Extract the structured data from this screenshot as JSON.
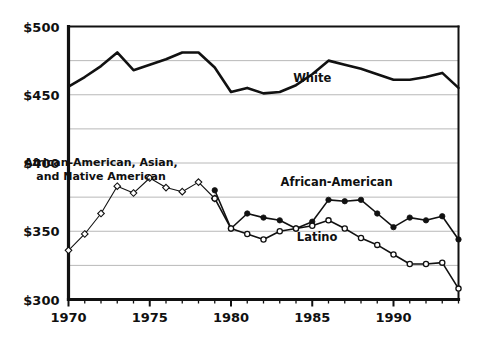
{
  "chart_data": {
    "type": "line",
    "title": "",
    "subtitle": "",
    "xlabel": "",
    "ylabel": "",
    "xlim": [
      1970,
      1994
    ],
    "ylim": [
      300,
      500
    ],
    "ytick_labels": [
      "$500",
      "$450",
      "$400",
      "$350",
      "$300"
    ],
    "ytick_values": [
      500,
      450,
      400,
      350,
      300
    ],
    "xtick_labels": [
      "1970",
      "1975",
      "1980",
      "1985",
      "1990"
    ],
    "xtick_values": [
      1970,
      1975,
      1980,
      1985,
      1990
    ],
    "minor_ytick_values": [
      475,
      425,
      375,
      325
    ],
    "grid": "horizontal",
    "grid_color": "#b8b8b8",
    "legend_position": "inline-annotations",
    "line_color": "#111111",
    "marker_open_fill": "#ffffff",
    "marker_closed_fill": "#111111",
    "series": [
      {
        "name": "White",
        "label": "White",
        "marker": "none",
        "line_width": 2.6,
        "label_x": 1985.0,
        "label_y": 459.0,
        "x": [
          1970,
          1971,
          1972,
          1973,
          1974,
          1975,
          1976,
          1977,
          1978,
          1979,
          1980,
          1981,
          1982,
          1983,
          1984,
          1985,
          1986,
          1987,
          1988,
          1989,
          1990,
          1991,
          1992,
          1993,
          1994
        ],
        "values": [
          456,
          463,
          471,
          481,
          468,
          472,
          476,
          481,
          481,
          470,
          452,
          455,
          451,
          452,
          457,
          465,
          475,
          472,
          469,
          465,
          461,
          461,
          463,
          466,
          455
        ]
      },
      {
        "name": "African-American, Asian, and Native American",
        "label": "African-American, Asian,\nand Native American",
        "label_line1": "African-American, Asian,",
        "label_line2": "and Native American",
        "marker": "open-diamond",
        "line_width": 1.1,
        "label_x": 1972.0,
        "label_y": 398.0,
        "x": [
          1970,
          1971,
          1972,
          1973,
          1974,
          1975,
          1976,
          1977,
          1978,
          1979
        ],
        "values": [
          336,
          348,
          363,
          383,
          378,
          389,
          382,
          379,
          386,
          374
        ]
      },
      {
        "name": "African-American",
        "label": "African-American",
        "marker": "closed-circle",
        "line_width": 1.6,
        "label_x": 1986.5,
        "label_y": 383.0,
        "x": [
          1979,
          1980,
          1981,
          1982,
          1983,
          1984,
          1985,
          1986,
          1987,
          1988,
          1989,
          1990,
          1991,
          1992,
          1993,
          1994
        ],
        "values": [
          380,
          352,
          363,
          360,
          358,
          352,
          357,
          373,
          372,
          373,
          363,
          353,
          360,
          358,
          361,
          344
        ]
      },
      {
        "name": "Latino",
        "label": "Latino",
        "marker": "open-circle",
        "line_width": 1.6,
        "label_x": 1985.3,
        "label_y": 343.0,
        "x": [
          1979,
          1980,
          1981,
          1982,
          1983,
          1984,
          1985,
          1986,
          1987,
          1988,
          1989,
          1990,
          1991,
          1992,
          1993,
          1994
        ],
        "values": [
          374,
          352,
          348,
          344,
          350,
          352,
          354,
          358,
          352,
          345,
          340,
          333,
          326,
          326,
          327,
          308
        ]
      }
    ]
  }
}
